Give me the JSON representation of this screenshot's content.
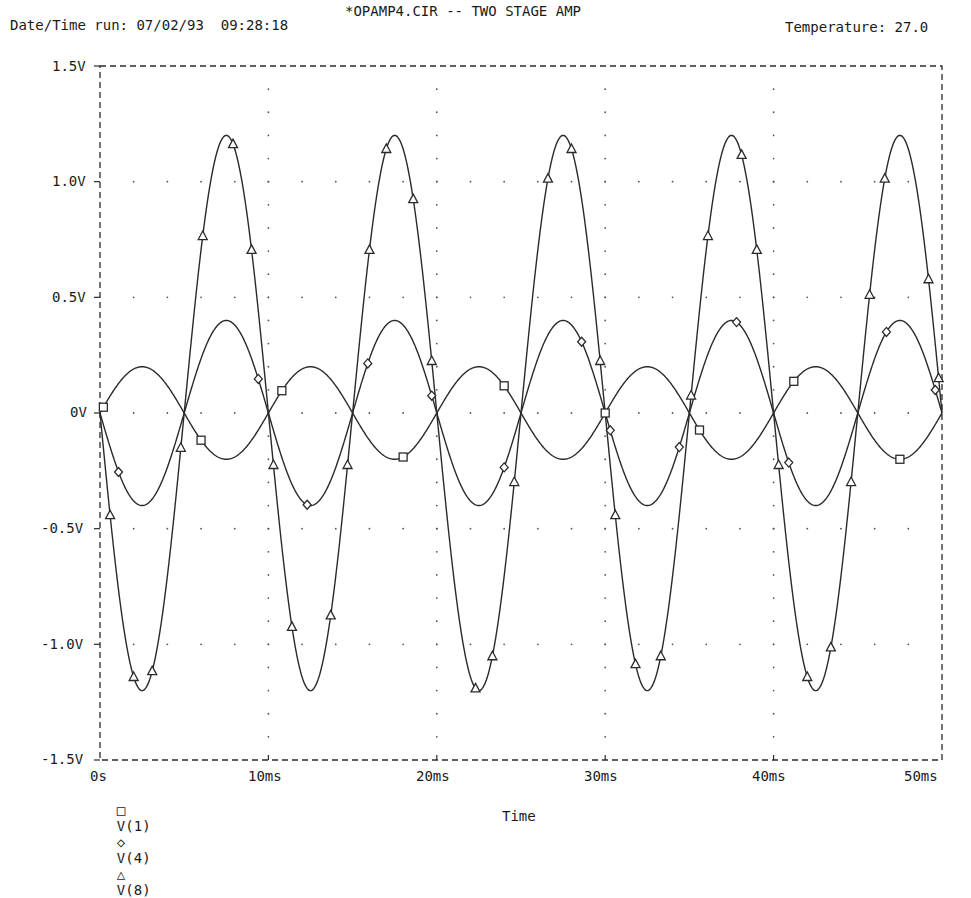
{
  "header": {
    "title": "*OPAMP4.CIR -- TWO STAGE AMP",
    "datetime": "Date/Time run: 07/02/93  09:28:18",
    "temperature": "Temperature: 27.0"
  },
  "axis": {
    "xlabel": "Time",
    "y_ticks": [
      "1.5V",
      "1.0V",
      "0.5V",
      "0V",
      "-0.5V",
      "-1.0V",
      "-1.5V"
    ],
    "x_ticks": [
      "0s",
      "10ms",
      "20ms",
      "30ms",
      "40ms",
      "50ms"
    ]
  },
  "legend": {
    "items": [
      {
        "marker": "square",
        "label": "V(1)"
      },
      {
        "marker": "diamond",
        "label": "V(4)"
      },
      {
        "marker": "triangle",
        "label": "V(8)"
      }
    ]
  },
  "colors": {
    "line": "#2a2a2a",
    "grid": "#555555",
    "background": "#ffffff"
  },
  "chart_data": {
    "type": "line",
    "title": "*OPAMP4.CIR -- TWO STAGE AMP",
    "subtitle": "Date/Time run: 07/02/93 09:28:18 | Temperature: 27.0",
    "xlabel": "Time",
    "ylabel": "",
    "xlim_ms": [
      0,
      50
    ],
    "ylim": [
      -1.5,
      1.5
    ],
    "grid": "dotted",
    "legend_position": "bottom-left",
    "x_ms": [
      0,
      1.25,
      2.5,
      3.75,
      5,
      6.25,
      7.5,
      8.75,
      10,
      11.25,
      12.5,
      13.75,
      15,
      16.25,
      17.5,
      18.75,
      20,
      21.25,
      22.5,
      23.75,
      25,
      26.25,
      27.5,
      28.75,
      30,
      31.25,
      32.5,
      33.75,
      35,
      36.25,
      37.5,
      38.75,
      40,
      41.25,
      42.5,
      43.75,
      45,
      46.25,
      47.5,
      48.75,
      50
    ],
    "series": [
      {
        "name": "V(1)",
        "marker": "square",
        "amplitude": 0.2,
        "period_ms": 10,
        "phase": "sin",
        "values": [
          0,
          0.14,
          0.2,
          0.14,
          0,
          -0.14,
          -0.2,
          -0.14,
          0,
          0.14,
          0.2,
          0.14,
          0,
          -0.14,
          -0.2,
          -0.14,
          0,
          0.14,
          0.2,
          0.14,
          0,
          -0.14,
          -0.2,
          -0.14,
          0,
          0.14,
          0.2,
          0.14,
          0,
          -0.14,
          -0.2,
          -0.14,
          0,
          0.14,
          0.2,
          0.14,
          0,
          -0.14,
          -0.2,
          -0.14,
          0
        ]
      },
      {
        "name": "V(4)",
        "marker": "diamond",
        "amplitude": 0.4,
        "period_ms": 10,
        "phase": "-sin",
        "values": [
          0,
          -0.28,
          -0.4,
          -0.28,
          0,
          0.28,
          0.4,
          0.28,
          0,
          -0.28,
          -0.4,
          -0.28,
          0,
          0.28,
          0.4,
          0.28,
          0,
          -0.28,
          -0.4,
          -0.28,
          0,
          0.28,
          0.4,
          0.28,
          0,
          -0.28,
          -0.4,
          -0.28,
          0,
          0.28,
          0.4,
          0.28,
          0,
          -0.28,
          -0.4,
          -0.28,
          0,
          0.28,
          0.4,
          0.28,
          0
        ]
      },
      {
        "name": "V(8)",
        "marker": "triangle",
        "amplitude": 1.2,
        "period_ms": 10,
        "phase": "-sin",
        "values": [
          0,
          -0.85,
          -1.2,
          -0.85,
          0,
          0.85,
          1.2,
          0.85,
          0,
          -0.85,
          -1.2,
          -0.85,
          0,
          0.85,
          1.2,
          0.85,
          0,
          -0.85,
          -1.2,
          -0.85,
          0,
          0.85,
          1.2,
          0.85,
          0,
          -0.85,
          -1.2,
          -0.85,
          0,
          0.85,
          1.2,
          0.85,
          0,
          -0.85,
          -1.2,
          -0.85,
          0,
          0.85,
          1.2,
          0.85,
          0
        ]
      }
    ]
  }
}
